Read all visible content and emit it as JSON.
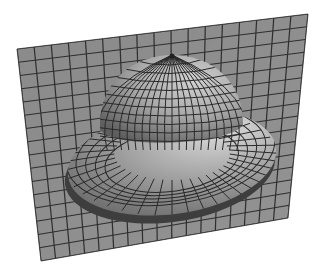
{
  "image": {
    "description": "3D shaded wireframe render of a hat-shaped surface (dome on a toroidal brim) rising from a tilted gridded plane",
    "background": "#ffffff",
    "plane": {
      "corners": [
        [
          17,
          49
        ],
        [
          308,
          14
        ],
        [
          288,
          218
        ],
        [
          41,
          261
        ]
      ],
      "cols": 17,
      "rows": 16,
      "fill": "#8c8c8c",
      "line": "#2e2e2e"
    },
    "brim": {
      "cx": 172,
      "cy": 162,
      "rx": 105,
      "ry": 52,
      "rotate": -8,
      "fill": "#9d9d9d",
      "shadow": "#555555"
    },
    "dome": {
      "cx": 170,
      "cy": 120,
      "rx": 72,
      "ry": 66,
      "top": [
        172,
        55
      ],
      "fill": "#a5a5a5",
      "highlight": "#d8d8d8"
    },
    "grid_line_color": "#2a2a2a"
  }
}
